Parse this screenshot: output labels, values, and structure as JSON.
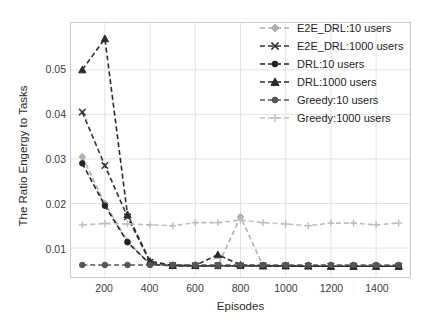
{
  "chart_data": {
    "type": "line",
    "title": "",
    "xlabel": "Episodes",
    "ylabel": "The Ratio Engergy to Tasks",
    "xlim": [
      50,
      1550
    ],
    "ylim": [
      0.0035,
      0.0605
    ],
    "grid": true,
    "legend_position": "top-right",
    "xticks": [
      200,
      400,
      600,
      800,
      1000,
      1200,
      1400
    ],
    "yticks": [
      0.01,
      0.02,
      0.03,
      0.04,
      0.05
    ],
    "ytick_labels": [
      "0.01",
      "0.02",
      "0.03",
      "0.04",
      "0.05"
    ],
    "xtick_labels": [
      "200",
      "400",
      "600",
      "800",
      "1000",
      "1200",
      "1400"
    ],
    "x": [
      100,
      200,
      300,
      400,
      500,
      600,
      700,
      800,
      900,
      1000,
      1100,
      1200,
      1300,
      1400,
      1500
    ],
    "series": [
      {
        "name": "E2E_DRL:10 users",
        "color": "#b0b0b0",
        "marker": "diamond",
        "linestyle": "dashed",
        "values": [
          0.0305,
          0.02,
          0.0115,
          0.0063,
          0.006,
          0.006,
          0.006,
          0.017,
          0.006,
          0.0059,
          0.0059,
          0.0059,
          0.0059,
          0.0059,
          0.0059
        ]
      },
      {
        "name": "E2E_DRL:1000 users",
        "color": "#333333",
        "marker": "x",
        "linestyle": "dashed",
        "values": [
          0.0405,
          0.0285,
          0.017,
          0.0068,
          0.0061,
          0.006,
          0.006,
          0.006,
          0.006,
          0.006,
          0.0059,
          0.0059,
          0.0059,
          0.0059,
          0.0059
        ]
      },
      {
        "name": "DRL:10 users",
        "color": "#222222",
        "marker": "circle",
        "linestyle": "dashed",
        "values": [
          0.029,
          0.0195,
          0.0113,
          0.0064,
          0.006,
          0.006,
          0.006,
          0.006,
          0.006,
          0.006,
          0.006,
          0.0059,
          0.0059,
          0.0059,
          0.0059
        ]
      },
      {
        "name": "DRL:1000 users",
        "color": "#2b2b2b",
        "marker": "triangle",
        "linestyle": "dashed",
        "values": [
          0.05,
          0.057,
          0.0175,
          0.007,
          0.0061,
          0.0061,
          0.0085,
          0.0062,
          0.006,
          0.006,
          0.006,
          0.0059,
          0.0059,
          0.0059,
          0.0059
        ]
      },
      {
        "name": "Greedy:10 users",
        "color": "#555555",
        "marker": "circle",
        "linestyle": "dashed",
        "values": [
          0.0062,
          0.0062,
          0.0062,
          0.0062,
          0.0062,
          0.0062,
          0.0062,
          0.0062,
          0.0062,
          0.0062,
          0.0062,
          0.0062,
          0.0062,
          0.0062,
          0.0062
        ]
      },
      {
        "name": "Greedy:1000 users",
        "color": "#bdbdbd",
        "marker": "plus",
        "linestyle": "dashed",
        "values": [
          0.0152,
          0.0155,
          0.0154,
          0.0152,
          0.015,
          0.0157,
          0.0157,
          0.0163,
          0.0157,
          0.0154,
          0.015,
          0.0156,
          0.0156,
          0.0152,
          0.0156
        ]
      }
    ]
  },
  "legend": {
    "items": [
      {
        "label": "E2E_DRL:10 users"
      },
      {
        "label": "E2E_DRL:1000 users"
      },
      {
        "label": "DRL:10 users"
      },
      {
        "label": "DRL:1000 users"
      },
      {
        "label": "Greedy:10 users"
      },
      {
        "label": "Greedy:1000 users"
      }
    ]
  }
}
